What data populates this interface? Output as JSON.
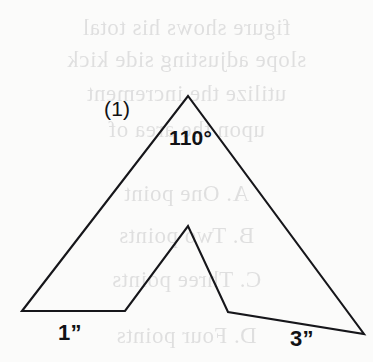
{
  "page": {
    "background_color": "#fbfbfa",
    "ink_color": "#16161a"
  },
  "figure": {
    "figure_number_label": "(1)",
    "apex_angle_label": "110°",
    "left_base_length_label": "1”",
    "right_base_length_label": "3”",
    "shape": {
      "type": "closed-polygon",
      "description": "arrowhead / notched-triangle outline",
      "vertices": [
        [
          22,
          311
        ],
        [
          188,
          96
        ],
        [
          364,
          334
        ],
        [
          228,
          312
        ],
        [
          188,
          226
        ],
        [
          125,
          311
        ]
      ]
    }
  },
  "bleed_through": {
    "note": "faint mirrored show-through text from the reverse side of the page",
    "lines": [
      "figure shows his total",
      "slope adjusting side kick",
      "utilize the increment",
      "upon the area of",
      "A. One point",
      "B. Two points",
      "C. Three points",
      "D. Four points"
    ]
  }
}
